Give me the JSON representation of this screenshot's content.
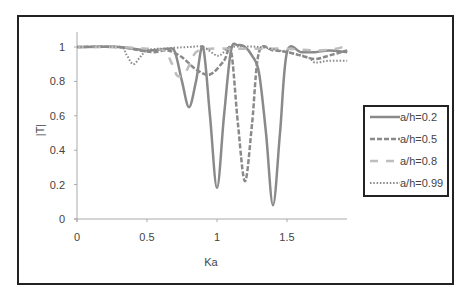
{
  "chart_data": {
    "type": "line",
    "title": "",
    "xlabel": "Ka",
    "ylabel": "|T|",
    "xlim": [
      0,
      1.93
    ],
    "ylim": [
      0,
      1.1
    ],
    "xticks": [
      0,
      0.5,
      1,
      1.5
    ],
    "xtick_labels": [
      "0",
      "0.5",
      "1",
      "1.5"
    ],
    "yticks": [
      0,
      0.2,
      0.4,
      0.6,
      0.8,
      1
    ],
    "ytick_labels": [
      "0",
      "0.2",
      "0.4",
      "0.6",
      "0.8",
      "1"
    ],
    "grid": false,
    "legend_position": "right",
    "series": [
      {
        "name": "a/h=0.2",
        "style": "solid",
        "color": "#8a8a8a",
        "x": [
          0,
          0.3,
          0.5,
          0.65,
          0.7,
          0.75,
          0.8,
          0.85,
          0.9,
          0.95,
          1.0,
          1.05,
          1.1,
          1.15,
          1.2,
          1.25,
          1.3,
          1.35,
          1.4,
          1.45,
          1.5,
          1.6,
          1.7,
          1.8,
          1.93
        ],
        "y": [
          1.0,
          1.0,
          0.98,
          0.99,
          0.97,
          0.8,
          0.65,
          0.8,
          1.0,
          0.6,
          0.18,
          0.6,
          0.98,
          1.01,
          1.0,
          0.95,
          0.85,
          0.5,
          0.08,
          0.5,
          0.97,
          0.97,
          0.97,
          0.98,
          0.97
        ]
      },
      {
        "name": "a/h=0.5",
        "style": "dashed",
        "color": "#8a8a8a",
        "x": [
          0,
          0.3,
          0.45,
          0.55,
          0.65,
          0.75,
          0.85,
          0.95,
          1.05,
          1.1,
          1.15,
          1.2,
          1.25,
          1.3,
          1.4,
          1.5,
          1.6,
          1.7,
          1.8,
          1.93
        ],
        "y": [
          1.0,
          1.0,
          0.98,
          0.97,
          0.98,
          0.94,
          0.87,
          0.84,
          0.92,
          0.98,
          0.55,
          0.22,
          0.55,
          0.97,
          0.98,
          0.97,
          0.95,
          0.93,
          0.95,
          0.98
        ]
      },
      {
        "name": "a/h=0.8",
        "style": "long-dash",
        "color": "#bdbdbd",
        "x": [
          0,
          0.3,
          0.5,
          0.62,
          0.68,
          0.72,
          0.78,
          0.85,
          0.95,
          1.1,
          1.3,
          1.5,
          1.7,
          1.85,
          1.93
        ],
        "y": [
          1.0,
          1.0,
          0.99,
          0.98,
          0.9,
          0.83,
          0.86,
          0.97,
          0.99,
          0.99,
          0.99,
          0.99,
          0.98,
          0.99,
          1.01
        ]
      },
      {
        "name": "a/h=0.99",
        "style": "dotted",
        "color": "#8a8a8a",
        "x": [
          0,
          0.3,
          0.35,
          0.4,
          0.45,
          0.5,
          0.6,
          0.8,
          0.9,
          1.0,
          1.05,
          1.1,
          1.3,
          1.5,
          1.65,
          1.7,
          1.8,
          1.93
        ],
        "y": [
          1.0,
          1.0,
          0.96,
          0.9,
          0.94,
          0.98,
          0.99,
          1.0,
          1.0,
          0.95,
          0.97,
          1.0,
          1.0,
          0.97,
          0.94,
          0.91,
          0.92,
          0.92
        ]
      }
    ]
  },
  "plot": {
    "origin_px": [
      77,
      219
    ],
    "x_scale_px_per_unit": 140,
    "y_scale_px_per_unit": 172,
    "x_end_px": 347
  },
  "labels": {
    "xlabel": "Ka",
    "ylabel": "|T|",
    "xticks": [
      "0",
      "0.5",
      "1",
      "1.5"
    ],
    "yticks": [
      "0",
      "0.2",
      "0.4",
      "0.6",
      "0.8",
      "1"
    ],
    "legend": [
      "a/h=0.2",
      "a/h=0.5",
      "a/h=0.8",
      "a/h=0.99"
    ]
  }
}
